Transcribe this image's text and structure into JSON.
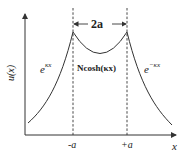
{
  "diagram": {
    "y_axis_label": "u(x)",
    "x_axis_label": "x",
    "width_annotation": "2a",
    "left_region_label": {
      "base": "e",
      "exponent": "κx"
    },
    "center_region_label": "Ncosh(κx)",
    "right_region_label": {
      "base": "e",
      "exponent": "−κx"
    },
    "tick_left": "-a",
    "tick_right": "+a",
    "colors": {
      "curve": "#333333",
      "axis": "#333333",
      "dashed": "#333333",
      "background": "#ffffff"
    }
  }
}
